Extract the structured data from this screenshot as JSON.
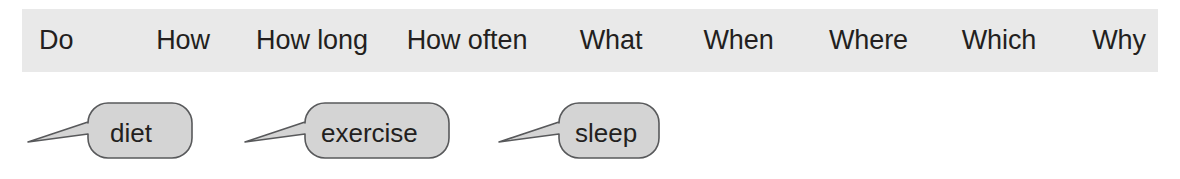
{
  "figure": {
    "background_color": "#ffffff",
    "band": {
      "background_color": "#e9e9e9",
      "text_color": "#231f20",
      "items": [
        {
          "label": "Do"
        },
        {
          "label": "How"
        },
        {
          "label": "How long"
        },
        {
          "label": "How often"
        },
        {
          "label": "What"
        },
        {
          "label": "When"
        },
        {
          "label": "Where"
        },
        {
          "label": "Which"
        },
        {
          "label": "Why"
        }
      ]
    },
    "bubbles": {
      "fill_color": "#d4d4d4",
      "stroke_color": "#58595b",
      "text_color": "#231f20",
      "items": [
        {
          "label": "diet"
        },
        {
          "label": "exercise"
        },
        {
          "label": "sleep"
        }
      ]
    }
  }
}
